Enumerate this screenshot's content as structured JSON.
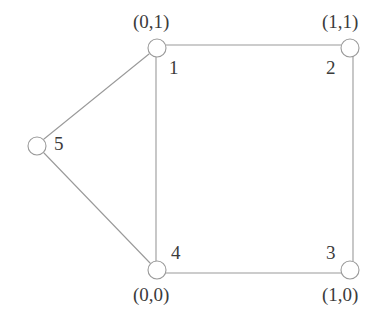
{
  "figure": {
    "type": "undirected-graph",
    "title": "",
    "background_color": "#ffffff",
    "edge_color": "#9a9a9a",
    "node_fill_color": "#ffffff",
    "node_stroke_color": "#9a9a9a",
    "text_color": "#3b3b3b",
    "width": 384,
    "height": 315
  },
  "graph_data": {
    "type": "graph",
    "node_count": 5,
    "edge_count": 6,
    "nodes": [
      {
        "id": "1",
        "label": "1",
        "coord_label": "(0,1)",
        "coord": [
          0,
          1
        ],
        "cx": 157,
        "cy": 48,
        "r": 9,
        "label_x": 169,
        "label_y": 58,
        "coord_x": 133,
        "coord_y": 12
      },
      {
        "id": "2",
        "label": "2",
        "coord_label": "(1,1)",
        "coord": [
          1,
          1
        ],
        "cx": 350,
        "cy": 48,
        "r": 9,
        "label_x": 326,
        "label_y": 58,
        "coord_x": 322,
        "coord_y": 12
      },
      {
        "id": "3",
        "label": "3",
        "coord_label": "(1,0)",
        "coord": [
          1,
          0
        ],
        "cx": 350,
        "cy": 270,
        "r": 9,
        "label_x": 326,
        "label_y": 243,
        "coord_x": 322,
        "coord_y": 285
      },
      {
        "id": "4",
        "label": "4",
        "coord_label": "(0,0)",
        "coord": [
          0,
          0
        ],
        "cx": 157,
        "cy": 270,
        "r": 9,
        "label_x": 171,
        "label_y": 243,
        "coord_x": 133,
        "coord_y": 285
      },
      {
        "id": "5",
        "label": "5",
        "coord_label": "",
        "coord": null,
        "cx": 37,
        "cy": 146,
        "r": 9,
        "label_x": 54,
        "label_y": 134,
        "coord_x": null,
        "coord_y": null
      }
    ],
    "edges": [
      {
        "id": "edge-1-2",
        "source": "1",
        "target": "2",
        "x1": 166,
        "y1": 45,
        "x2": 341,
        "y2": 45
      },
      {
        "id": "edge-2-3",
        "source": "2",
        "target": "3",
        "x1": 353,
        "y1": 57,
        "x2": 353,
        "y2": 261
      },
      {
        "id": "edge-3-4",
        "source": "3",
        "target": "4",
        "x1": 341,
        "y1": 273,
        "x2": 166,
        "y2": 273
      },
      {
        "id": "edge-4-1",
        "source": "4",
        "target": "1",
        "x1": 156,
        "y1": 261,
        "x2": 156,
        "y2": 57
      },
      {
        "id": "edge-1-5",
        "source": "1",
        "target": "5",
        "x1": 149,
        "y1": 54,
        "x2": 44,
        "y2": 139
      },
      {
        "id": "edge-5-4",
        "source": "5",
        "target": "4",
        "x1": 44,
        "y1": 153,
        "x2": 150,
        "y2": 263
      }
    ]
  }
}
